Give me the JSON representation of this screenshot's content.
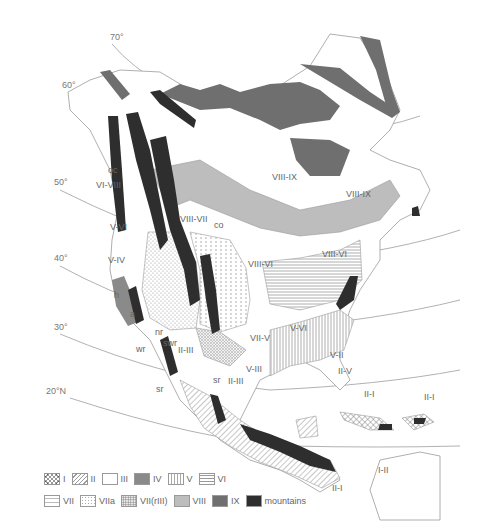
{
  "map": {
    "latitude_labels": [
      {
        "text": "70°",
        "x": 110,
        "y": 40
      },
      {
        "text": "60°",
        "x": 62,
        "y": 88
      },
      {
        "text": "50°",
        "x": 54,
        "y": 185
      },
      {
        "text": "40°",
        "x": 54,
        "y": 261
      },
      {
        "text": "30°",
        "x": 54,
        "y": 330
      },
      {
        "text": "20°N",
        "x": 46,
        "y": 394
      }
    ],
    "zone_labels": [
      {
        "text": "oc",
        "x": 108,
        "y": 173
      },
      {
        "text": "VI-VIII",
        "x": 96,
        "y": 188
      },
      {
        "text": "V-VI",
        "x": 110,
        "y": 230
      },
      {
        "text": "V-IV",
        "x": 108,
        "y": 263
      },
      {
        "text": "h",
        "x": 114,
        "y": 298
      },
      {
        "text": "a",
        "x": 130,
        "y": 317
      },
      {
        "text": "nr",
        "x": 155,
        "y": 335
      },
      {
        "text": "swr",
        "x": 163,
        "y": 346
      },
      {
        "text": "wr",
        "x": 136,
        "y": 352
      },
      {
        "text": "II-III",
        "x": 178,
        "y": 353
      },
      {
        "text": "sr",
        "x": 156,
        "y": 392
      },
      {
        "text": "sr",
        "x": 213,
        "y": 383
      },
      {
        "text": "II-III",
        "x": 228,
        "y": 384
      },
      {
        "text": "V-III",
        "x": 246,
        "y": 372
      },
      {
        "text": "VII-V",
        "x": 250,
        "y": 341
      },
      {
        "text": "V-VI",
        "x": 290,
        "y": 331
      },
      {
        "text": "V-II",
        "x": 330,
        "y": 358
      },
      {
        "text": "II-V",
        "x": 338,
        "y": 374
      },
      {
        "text": "II-I",
        "x": 364,
        "y": 397
      },
      {
        "text": "II-I",
        "x": 424,
        "y": 400
      },
      {
        "text": "VIII-VII",
        "x": 180,
        "y": 222
      },
      {
        "text": "co",
        "x": 214,
        "y": 228
      },
      {
        "text": "VIII-VI",
        "x": 248,
        "y": 267
      },
      {
        "text": "VIII-VI",
        "x": 322,
        "y": 257
      },
      {
        "text": "VIII-IX",
        "x": 272,
        "y": 180
      },
      {
        "text": "VIII-IX",
        "x": 346,
        "y": 197
      },
      {
        "text": "I-II",
        "x": 378,
        "y": 473
      },
      {
        "text": "II-I",
        "x": 332,
        "y": 491
      }
    ]
  },
  "legend": {
    "row1": [
      {
        "id": "I",
        "label": "I",
        "pattern": "crosshatch"
      },
      {
        "id": "II",
        "label": "II",
        "pattern": "diagonal"
      },
      {
        "id": "III",
        "label": "III",
        "pattern": "blank"
      },
      {
        "id": "IV",
        "label": "IV",
        "pattern": "solid-mid"
      },
      {
        "id": "V",
        "label": "V",
        "pattern": "vertical"
      },
      {
        "id": "VI",
        "label": "VI",
        "pattern": "horizontal"
      }
    ],
    "row2": [
      {
        "id": "VII",
        "label": "VII",
        "pattern": "dashes"
      },
      {
        "id": "VIIa",
        "label": "VIIa",
        "pattern": "dots"
      },
      {
        "id": "VII(rIII)",
        "label": "VII(rIII)",
        "pattern": "dense-dots"
      },
      {
        "id": "VIII",
        "label": "VIII",
        "pattern": "solid-light"
      },
      {
        "id": "IX",
        "label": "IX",
        "pattern": "solid-dark"
      },
      {
        "id": "mountains",
        "label": "mountains",
        "pattern": "solid-black"
      }
    ]
  },
  "colors": {
    "outline": "#9a9a9a",
    "zone_VIII": "#bdbdbd",
    "zone_IX": "#6f6f6f",
    "zone_IV": "#8a8a8a",
    "mountains": "#2e2e2e",
    "hatch": "#8f8f8f",
    "label": "#666666"
  }
}
